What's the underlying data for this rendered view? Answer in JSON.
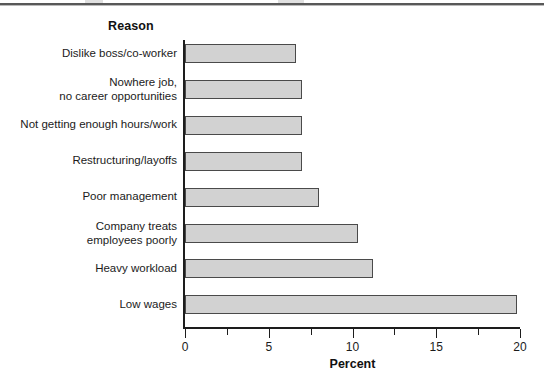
{
  "figure": {
    "category_header": "Reason",
    "x_axis_title": "Percent"
  },
  "chart_data": {
    "type": "bar",
    "orientation": "horizontal",
    "title": "",
    "subtitle": "",
    "xlabel": "Percent",
    "ylabel": "Reason",
    "xlim": [
      0,
      20
    ],
    "grid": false,
    "legend": null,
    "bar_color": "#d2d2d2",
    "bar_edge_color": "#4a4a4a",
    "x_ticks_major": [
      0,
      5,
      10,
      15,
      20
    ],
    "x_ticks_major_labels": [
      "0",
      "5",
      "10",
      "15",
      "20"
    ],
    "x_ticks_minor": [
      2.5,
      7.5,
      12.5,
      17.5
    ],
    "categories": [
      "Dislike boss/co-worker",
      "Nowhere job,\nno career opportunities",
      "Not getting enough hours/work",
      "Restructuring/layoffs",
      "Poor management",
      "Company treats\nemployees poorly",
      "Heavy workload",
      "Low wages"
    ],
    "values": [
      6.6,
      7.0,
      7.0,
      7.0,
      8.0,
      10.3,
      11.2,
      19.8
    ]
  }
}
